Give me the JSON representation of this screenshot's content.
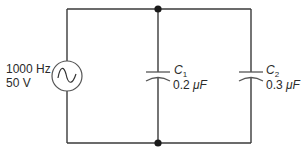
{
  "diagram": {
    "type": "circuit",
    "source": {
      "kind": "ac-voltage-source",
      "icon": "sine-wave-icon",
      "frequency_label": "1000 Hz",
      "voltage_label": "50 V"
    },
    "capacitors": [
      {
        "name": "C",
        "subscript": "1",
        "value": "0.2",
        "unit": "μF"
      },
      {
        "name": "C",
        "subscript": "2",
        "value": "0.3",
        "unit": "μF"
      }
    ],
    "junctions": 2,
    "colors": {
      "wire": "#3a3a3a",
      "text": "#2a2a2a",
      "background": "#ffffff"
    }
  }
}
